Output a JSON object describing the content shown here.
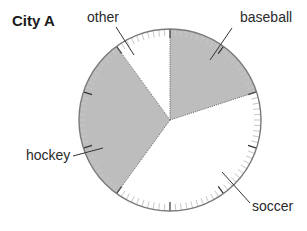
{
  "chart_data": {
    "type": "pie",
    "title": "City A",
    "categories": [
      "baseball",
      "soccer",
      "hockey",
      "other"
    ],
    "values": [
      20,
      40,
      30,
      10
    ],
    "unit": "%",
    "start_angle_deg": 0,
    "direction": "clockwise",
    "shaded": [
      true,
      false,
      true,
      false
    ],
    "colors": {
      "shaded": "#bdbdbd",
      "unshaded": "#ffffff",
      "outline": "#7a7a7a",
      "tick_major": "#333333",
      "tick_minor": "#c8c8c8"
    },
    "ticks": {
      "minor_count": 100,
      "major_every": 10
    },
    "labels": [
      {
        "text": "baseball",
        "x": 240,
        "y": 22,
        "leader": [
          [
            232,
            28
          ],
          [
            210,
            60
          ]
        ]
      },
      {
        "text": "soccer",
        "x": 252,
        "y": 211,
        "leader": [
          [
            250,
            203
          ],
          [
            222,
            172
          ]
        ]
      },
      {
        "text": "hockey",
        "x": 26,
        "y": 160,
        "leader": [
          [
            73,
            156
          ],
          [
            103,
            148
          ]
        ]
      },
      {
        "text": "other",
        "x": 87,
        "y": 22,
        "leader": [
          [
            116,
            27
          ],
          [
            134,
            55
          ]
        ]
      }
    ]
  }
}
